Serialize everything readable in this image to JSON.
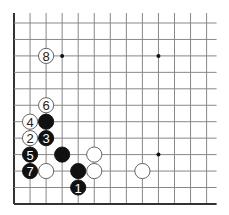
{
  "diagram": {
    "type": "go-board-partial",
    "grid": {
      "cols": 13,
      "rows": 12,
      "x0": 14,
      "y0": 23,
      "dx": 16.05,
      "dy": 16.45,
      "left_edge": true,
      "bottom_edge": true,
      "line_color": "#888888",
      "edge_color": "#333333"
    },
    "star_points": [
      {
        "col": 3,
        "row": 2
      },
      {
        "col": 9,
        "row": 2
      },
      {
        "col": 9,
        "row": 8
      }
    ],
    "stones": [
      {
        "color": "white",
        "col": 2,
        "row": 2,
        "label": "8"
      },
      {
        "color": "white",
        "col": 2,
        "row": 5,
        "label": "6"
      },
      {
        "color": "white",
        "col": 1,
        "row": 6,
        "label": "4"
      },
      {
        "color": "black",
        "col": 2,
        "row": 6,
        "label": ""
      },
      {
        "color": "white",
        "col": 1,
        "row": 7,
        "label": "2"
      },
      {
        "color": "black",
        "col": 2,
        "row": 7,
        "label": "3"
      },
      {
        "color": "black",
        "col": 1,
        "row": 8,
        "label": "5"
      },
      {
        "color": "black",
        "col": 3,
        "row": 8,
        "label": ""
      },
      {
        "color": "white",
        "col": 5,
        "row": 8,
        "label": ""
      },
      {
        "color": "black",
        "col": 1,
        "row": 9,
        "label": "7"
      },
      {
        "color": "white",
        "col": 2,
        "row": 9,
        "label": ""
      },
      {
        "color": "black",
        "col": 4,
        "row": 9,
        "label": ""
      },
      {
        "color": "white",
        "col": 5,
        "row": 9,
        "label": ""
      },
      {
        "color": "white",
        "col": 8,
        "row": 9,
        "label": ""
      },
      {
        "color": "black",
        "col": 4,
        "row": 10,
        "label": "1"
      }
    ],
    "colors": {
      "black_stone": "#111111",
      "white_stone": "#ffffff",
      "white_stroke": "#555555"
    }
  }
}
